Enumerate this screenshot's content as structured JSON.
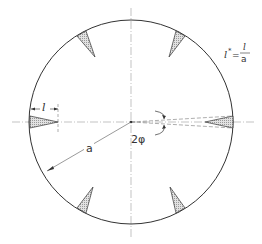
{
  "figure": {
    "type": "technical-diagram",
    "colors": {
      "line": "#333333",
      "centerline": "#9a9a9a",
      "notch_fill": "#d6d6d6",
      "background": "#ffffff"
    }
  },
  "labels": {
    "radius": "a",
    "notch_length": "l",
    "angle": "2φ",
    "formula_lhs": "l",
    "formula_star": "*",
    "formula_eq": "=",
    "formula_num": "l",
    "formula_den": "a"
  },
  "geometry": {
    "center": [
      131,
      122
    ],
    "radius": 102,
    "notch_count": 6,
    "notch_angles_deg": [
      0,
      60,
      120,
      180,
      240,
      300
    ]
  }
}
